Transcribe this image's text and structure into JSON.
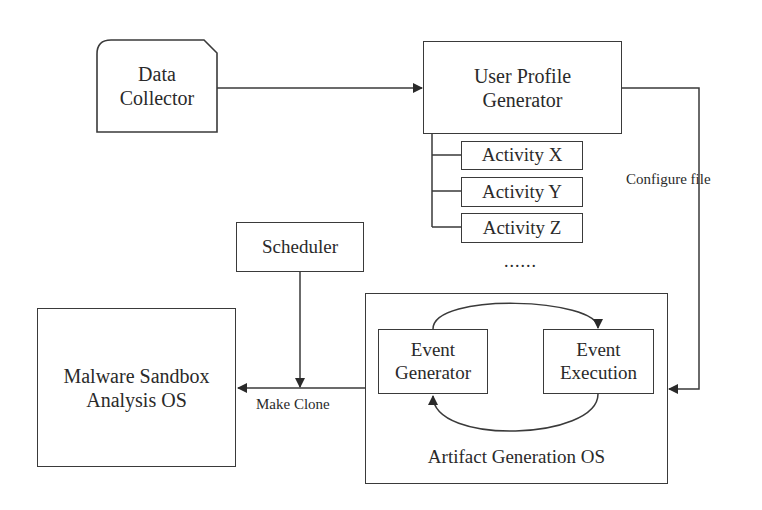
{
  "diagram": {
    "nodes": {
      "data_collector": {
        "line1": "Data",
        "line2": "Collector",
        "shape": "cut-corner-rectangle"
      },
      "user_profile_generator": {
        "line1": "User Profile",
        "line2": "Generator"
      },
      "activities": [
        {
          "label": "Activity X"
        },
        {
          "label": "Activity Y"
        },
        {
          "label": "Activity Z"
        }
      ],
      "activity_ellipsis": "......",
      "scheduler": {
        "label": "Scheduler"
      },
      "malware_sandbox": {
        "line1": "Malware Sandbox",
        "line2": "Analysis OS"
      },
      "artifact_generation_os": {
        "label": "Artifact Generation OS",
        "event_generator": {
          "line1": "Event",
          "line2": "Generator"
        },
        "event_execution": {
          "line1": "Event",
          "line2": "Execution"
        }
      }
    },
    "edge_labels": {
      "configure_file": "Configure file",
      "make_clone": "Make Clone"
    },
    "edges": [
      {
        "from": "Data Collector",
        "to": "User Profile Generator"
      },
      {
        "from": "User Profile Generator",
        "to": "Artifact Generation OS",
        "label": "Configure file"
      },
      {
        "from": "Artifact Generation OS",
        "to": "Malware Sandbox Analysis OS",
        "label": "Make Clone"
      },
      {
        "from": "Scheduler",
        "to": "Make Clone edge"
      },
      {
        "from": "Event Generator",
        "to": "Event Execution"
      },
      {
        "from": "Event Execution",
        "to": "Event Generator"
      }
    ],
    "colors": {
      "stroke": "#3a3a3a",
      "text": "#2a2a2a",
      "background": "#ffffff"
    }
  }
}
